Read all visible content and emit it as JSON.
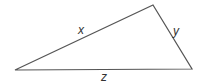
{
  "diagram": {
    "type": "triangle",
    "stroke_color": "#555555",
    "vertices": {
      "left": [
        15,
        70
      ],
      "top": [
        153,
        5
      ],
      "right": [
        192,
        69
      ]
    },
    "sides": [
      {
        "label": "x",
        "from": "left",
        "to": "top"
      },
      {
        "label": "y",
        "from": "top",
        "to": "right"
      },
      {
        "label": "z",
        "from": "left",
        "to": "right"
      }
    ]
  }
}
